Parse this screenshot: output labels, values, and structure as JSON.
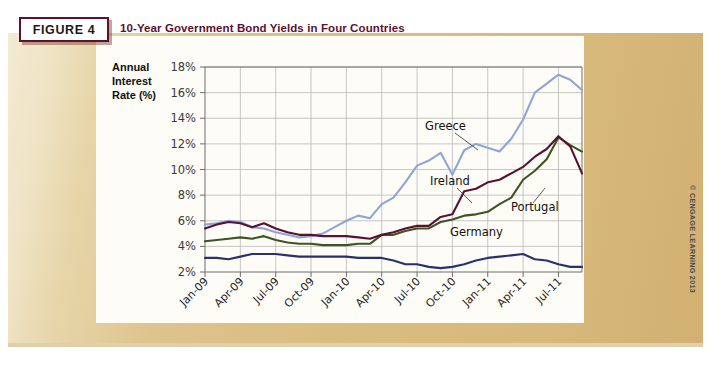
{
  "figure": {
    "badge_label": "FIGURE 4",
    "title": "10-Year Government Bond Yields in Four Countries",
    "credit": "© CENGAGE LEARNING 2013"
  },
  "colors": {
    "badge_border": "#5d1030",
    "title_text": "#5d1030",
    "panel_bg": "#fdfcf7",
    "band_gold": "#d9bc7f",
    "greece": "#8fa5d8",
    "ireland": "#5a1030",
    "portugal": "#3d5420",
    "germany": "#27316f"
  },
  "chart_data": {
    "type": "line",
    "title": "10-Year Government Bond Yields in Four Countries",
    "xlabel": "",
    "ylabel": "Annual Interest Rate (%)",
    "ylim": [
      2,
      18
    ],
    "ytick_labels": [
      "2%",
      "4%",
      "6%",
      "8%",
      "10%",
      "12%",
      "14%",
      "16%",
      "18%"
    ],
    "ytick_values": [
      2,
      4,
      6,
      8,
      10,
      12,
      14,
      16,
      18
    ],
    "grid": true,
    "legend": "inline-annotations",
    "xtick_labels": [
      "Jan-09",
      "Apr-09",
      "Jul-09",
      "Oct-09",
      "Jan-10",
      "Apr-10",
      "Jul-10",
      "Oct-10",
      "Jan-11",
      "Apr-11",
      "Jul-11"
    ],
    "x": [
      "Jan-09",
      "Feb-09",
      "Mar-09",
      "Apr-09",
      "May-09",
      "Jun-09",
      "Jul-09",
      "Aug-09",
      "Sep-09",
      "Oct-09",
      "Nov-09",
      "Dec-09",
      "Jan-10",
      "Feb-10",
      "Mar-10",
      "Apr-10",
      "May-10",
      "Jun-10",
      "Jul-10",
      "Aug-10",
      "Sep-10",
      "Oct-10",
      "Nov-10",
      "Dec-10",
      "Jan-11",
      "Feb-11",
      "Mar-11",
      "Apr-11",
      "May-11",
      "Jun-11",
      "Jul-11",
      "Aug-11",
      "Sep-11"
    ],
    "series": [
      {
        "name": "Greece",
        "color": "#8fa5d8",
        "values": [
          5.7,
          5.8,
          6.0,
          5.9,
          5.5,
          5.4,
          5.1,
          4.9,
          4.7,
          4.8,
          5.0,
          5.5,
          6.0,
          6.4,
          6.2,
          7.3,
          7.8,
          9.0,
          10.3,
          10.7,
          11.3,
          9.6,
          11.5,
          12.0,
          11.7,
          11.4,
          12.4,
          13.9,
          16.0,
          16.7,
          17.4,
          17.0,
          16.2
        ]
      },
      {
        "name": "Ireland",
        "color": "#5a1030",
        "values": [
          5.4,
          5.7,
          5.9,
          5.8,
          5.5,
          5.8,
          5.4,
          5.1,
          4.9,
          4.9,
          4.8,
          4.8,
          4.8,
          4.7,
          4.6,
          4.9,
          5.1,
          5.4,
          5.6,
          5.6,
          6.3,
          6.5,
          8.3,
          8.5,
          9.0,
          9.2,
          9.7,
          10.2,
          11.0,
          11.6,
          12.6,
          11.8,
          9.7
        ]
      },
      {
        "name": "Portugal",
        "color": "#3d5420",
        "values": [
          4.4,
          4.5,
          4.6,
          4.7,
          4.6,
          4.8,
          4.5,
          4.3,
          4.2,
          4.2,
          4.1,
          4.1,
          4.1,
          4.2,
          4.2,
          4.9,
          4.9,
          5.2,
          5.4,
          5.4,
          5.9,
          6.1,
          6.4,
          6.5,
          6.7,
          7.3,
          7.8,
          9.2,
          9.9,
          10.8,
          12.5,
          11.9,
          11.4
        ]
      },
      {
        "name": "Germany",
        "color": "#27316f",
        "values": [
          3.1,
          3.1,
          3.0,
          3.2,
          3.4,
          3.4,
          3.4,
          3.3,
          3.2,
          3.2,
          3.2,
          3.2,
          3.2,
          3.1,
          3.1,
          3.1,
          2.9,
          2.6,
          2.6,
          2.4,
          2.3,
          2.4,
          2.6,
          2.9,
          3.1,
          3.2,
          3.3,
          3.4,
          3.0,
          2.9,
          2.6,
          2.4,
          2.4
        ]
      }
    ],
    "annotations": [
      {
        "label": "Greece",
        "x": 425,
        "y": 130,
        "leader": [
          [
            455,
            133
          ],
          [
            478,
            150
          ]
        ]
      },
      {
        "label": "Ireland",
        "x": 430,
        "y": 185,
        "leader": [
          [
            457,
            188
          ],
          [
            472,
            203
          ]
        ]
      },
      {
        "label": "Portugal",
        "x": 511,
        "y": 211,
        "leader": [
          [
            533,
            203
          ],
          [
            545,
            188
          ]
        ]
      },
      {
        "label": "Germany",
        "x": 450,
        "y": 236
      }
    ]
  }
}
